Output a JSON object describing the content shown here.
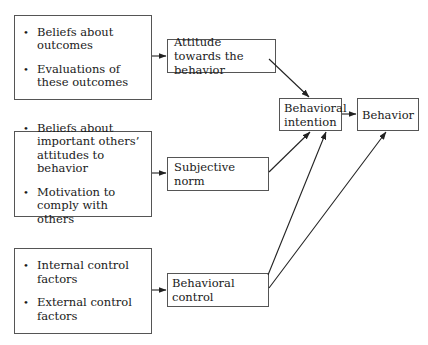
{
  "diagram": {
    "type": "theory-of-planned-behavior",
    "factor_groups": [
      {
        "id": "attitude-factors",
        "items": [
          "Beliefs about outcomes",
          "Evaluations of these outcomes"
        ]
      },
      {
        "id": "norm-factors",
        "items": [
          "Beliefs about important others’ attitudes to behavior",
          "Motivation to comply with others"
        ]
      },
      {
        "id": "control-factors",
        "items": [
          "Internal control factors",
          "External control factors"
        ]
      }
    ],
    "nodes": {
      "attitude": "Attitude towards the behavior",
      "subjective_norm": "Subjective norm",
      "behavioral_control": "Behavioral control",
      "intention": "Behavioral intention",
      "behavior": "Behavior"
    },
    "edges": [
      {
        "from": "attitude-factors",
        "to": "attitude"
      },
      {
        "from": "norm-factors",
        "to": "subjective_norm"
      },
      {
        "from": "control-factors",
        "to": "behavioral_control"
      },
      {
        "from": "attitude",
        "to": "intention"
      },
      {
        "from": "subjective_norm",
        "to": "intention"
      },
      {
        "from": "behavioral_control",
        "to": "intention"
      },
      {
        "from": "behavioral_control",
        "to": "behavior"
      },
      {
        "from": "intention",
        "to": "behavior"
      }
    ],
    "bullet_glyph": "•",
    "line_color": "#222222"
  }
}
